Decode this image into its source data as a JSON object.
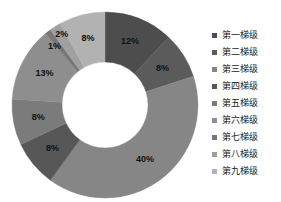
{
  "chart_data": {
    "type": "pie",
    "variant": "donut",
    "title": "",
    "subtitle": "",
    "xlabel": "",
    "ylabel": "",
    "grid": false,
    "legend_position": "right",
    "start_angle_deg": 0,
    "direction": "clockwise",
    "inner_radius_ratio": 0.46,
    "categories": [
      "第一梯级",
      "第二梯级",
      "第三梯级",
      "第四梯级",
      "第五梯级",
      "第六梯级",
      "第七梯级",
      "第八梯级",
      "第九梯级"
    ],
    "values": [
      12,
      8,
      40,
      8,
      8,
      13,
      1,
      2,
      8
    ],
    "data_labels": [
      "12%",
      "8%",
      "40%",
      "8%",
      "8%",
      "13%",
      "1%",
      "2%",
      "8%"
    ],
    "colors": [
      "#4d4d4d",
      "#5b5b5b",
      "#868686",
      "#575757",
      "#7b7b7b",
      "#8e8e8e",
      "#777777",
      "#a0a0a0",
      "#b2b2b2"
    ]
  },
  "legend": {
    "items": [
      {
        "label": "第一梯级",
        "color": "#4d4d4d"
      },
      {
        "label": "第二梯级",
        "color": "#5b5b5b"
      },
      {
        "label": "第三梯级",
        "color": "#868686"
      },
      {
        "label": "第四梯级",
        "color": "#575757"
      },
      {
        "label": "第五梯级",
        "color": "#7b7b7b"
      },
      {
        "label": "第六梯级",
        "color": "#8e8e8e"
      },
      {
        "label": "第七梯级",
        "color": "#777777"
      },
      {
        "label": "第八梯级",
        "color": "#a0a0a0"
      },
      {
        "label": "第九梯级",
        "color": "#b2b2b2"
      }
    ]
  },
  "geometry": {
    "center_x": 105,
    "center_y": 105,
    "outer_radius": 93,
    "inner_radius": 43,
    "label_radius": 68
  }
}
